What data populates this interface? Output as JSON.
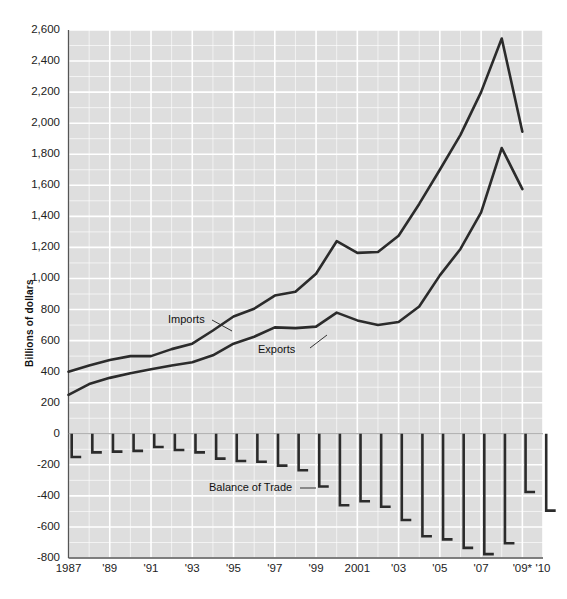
{
  "figure": {
    "background": "#ffffff",
    "plot_background": "#dedede",
    "gridline_color": "#ffffff",
    "line_color": "#2b2b2b",
    "axis_color": "#555555"
  },
  "chart_data": {
    "type": "line",
    "title": "",
    "subtitle": "",
    "xlabel": "",
    "ylabel": "Billions of dollars",
    "ylim": [
      -800,
      2600
    ],
    "grid": true,
    "legend_position": "inline-annotations",
    "x": [
      1987,
      1988,
      1989,
      1990,
      1991,
      1992,
      1993,
      1994,
      1995,
      1996,
      1997,
      1998,
      1999,
      2000,
      2001,
      2002,
      2003,
      2004,
      2005,
      2006,
      2007,
      2008,
      2009,
      2010
    ],
    "x_tick_labels": [
      "1987",
      "'89",
      "'91",
      "'93",
      "'95",
      "'97",
      "'99",
      "2001",
      "'03",
      "'05",
      "'07",
      "'09*",
      "'10"
    ],
    "x_tick_values": [
      1987,
      1989,
      1991,
      1993,
      1995,
      1997,
      1999,
      2001,
      2003,
      2005,
      2007,
      2009,
      2010
    ],
    "y_tick_labels": [
      "2,600",
      "2,400",
      "2,200",
      "2,000",
      "1,800",
      "1,600",
      "1,400",
      "1,200",
      "1,000",
      "800",
      "600",
      "400",
      "200",
      "0",
      "-200",
      "-400",
      "-600",
      "-800"
    ],
    "y_tick_values": [
      2600,
      2400,
      2200,
      2000,
      1800,
      1600,
      1400,
      1200,
      1000,
      800,
      600,
      400,
      200,
      0,
      -200,
      -400,
      -600,
      -800
    ],
    "series": [
      {
        "name": "Imports",
        "label": "Imports",
        "values": [
          400,
          440,
          475,
          500,
          500,
          545,
          580,
          665,
          755,
          805,
          890,
          915,
          1030,
          1240,
          1165,
          1170,
          1275,
          1480,
          1700,
          1925,
          2200,
          2545,
          1945,
          null
        ]
      },
      {
        "name": "Exports",
        "label": "Exports",
        "values": [
          250,
          320,
          360,
          390,
          415,
          440,
          460,
          505,
          580,
          625,
          685,
          680,
          690,
          780,
          730,
          700,
          720,
          820,
          1020,
          1190,
          1425,
          1840,
          1575,
          null
        ]
      },
      {
        "name": "Balance of Trade",
        "label": "Balance of Trade",
        "type": "bar",
        "values": [
          -150,
          -120,
          -115,
          -110,
          -85,
          -105,
          -120,
          -160,
          -175,
          -180,
          -205,
          -235,
          -340,
          -460,
          -435,
          -470,
          -555,
          -660,
          -680,
          -735,
          -775,
          -705,
          -375,
          -495
        ]
      }
    ],
    "annotations": [
      {
        "text": "Imports",
        "kind": "series-label"
      },
      {
        "text": "Exports",
        "kind": "series-label"
      },
      {
        "text": "Balance of Trade",
        "kind": "series-label"
      }
    ],
    "footnote_marker": "*"
  }
}
